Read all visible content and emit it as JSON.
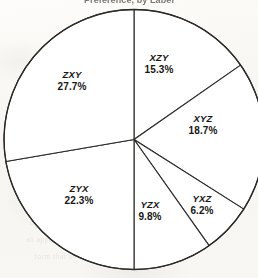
{
  "chart_data": {
    "type": "pie",
    "title": "Preference, by Label",
    "categories": [
      "XZY",
      "XYZ",
      "YXZ",
      "YZX",
      "ZYX",
      "ZXY"
    ],
    "values": [
      15.3,
      18.7,
      6.2,
      9.8,
      22.3,
      27.7
    ],
    "value_labels": [
      "15.3%",
      "18.7%",
      "6.2%",
      "9.8%",
      "22.3%",
      "27.7%"
    ],
    "units": "percent",
    "total": 100.0,
    "start_angle_deg": 0,
    "direction": "clockwise",
    "legend": "none",
    "labels_position": "inside-slice",
    "grid": false,
    "xlabel": "",
    "ylabel": "",
    "fill_color": "#ffffff",
    "stroke_color": "#2b2926"
  },
  "slices": [
    {
      "category": "XZY",
      "percent_label": "15.3%",
      "label_x": 159,
      "label_y": 59
    },
    {
      "category": "XYZ",
      "percent_label": "18.7%",
      "label_x": 203,
      "label_y": 120
    },
    {
      "category": "YXZ",
      "percent_label": "6.2%",
      "label_x": 202,
      "label_y": 200
    },
    {
      "category": "YZX",
      "percent_label": "9.8%",
      "label_x": 150,
      "label_y": 206
    },
    {
      "category": "ZYX",
      "percent_label": "22.3%",
      "label_x": 79,
      "label_y": 190
    },
    {
      "category": "ZXY",
      "percent_label": "27.7%",
      "label_x": 72,
      "label_y": 76
    }
  ],
  "background_marks": [
    {
      "text": "to the ringworm of the 1112",
      "x": 72,
      "y": 101
    },
    {
      "text": "concert has dispersed since",
      "x": 30,
      "y": 218
    },
    {
      "text": "an appropriate as any other",
      "x": 26,
      "y": 235
    },
    {
      "text": "form that of the seams in",
      "x": 34,
      "y": 252
    }
  ]
}
